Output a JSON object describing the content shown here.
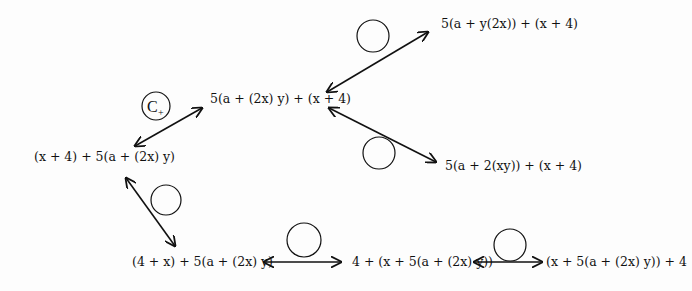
{
  "diagram": {
    "nodes": {
      "center": "5(a + (2x) y) + (x + 4)",
      "top_right": "5(a + y(2x)) + (x + 4)",
      "mid_right": "5(a + 2(xy)) + (x + 4)",
      "left": "(x + 4) + 5(a + (2x) y)",
      "bottom_left": "(4 + x) + 5(a + (2x) y)",
      "bottom_mid": "4 + (x + 5(a + (2x) y))",
      "bottom_right": "(x + 5(a + (2x) y)) + 4"
    },
    "edges": [
      {
        "from": "left",
        "to": "center",
        "label": "C",
        "label_sub": "+"
      },
      {
        "from": "center",
        "to": "top_right",
        "label": ""
      },
      {
        "from": "center",
        "to": "mid_right",
        "label": ""
      },
      {
        "from": "left",
        "to": "bottom_left",
        "label": ""
      },
      {
        "from": "bottom_left",
        "to": "bottom_mid",
        "label": ""
      },
      {
        "from": "bottom_mid",
        "to": "bottom_right",
        "label": ""
      }
    ]
  }
}
